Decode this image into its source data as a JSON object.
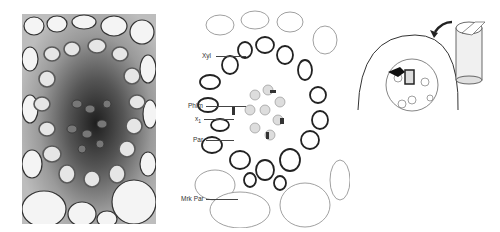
{
  "figure": {
    "panels": [
      {
        "id": "micrograph",
        "description": "light micrograph of vascular bundle cross-section"
      },
      {
        "id": "drawing",
        "description": "line drawing of vascular bundle"
      },
      {
        "id": "orientation",
        "description": "stem orientation diagram with cylinder and arrow"
      }
    ],
    "labels": [
      {
        "text": "Xyl",
        "x": 202,
        "y": 56
      },
      {
        "text": "Phlm",
        "x": 188,
        "y": 106
      },
      {
        "text": "x",
        "sub": "1",
        "x": 195,
        "y": 119
      },
      {
        "text": "Par",
        "x": 193,
        "y": 140
      },
      {
        "text": "Mrk Par",
        "x": 181,
        "y": 199
      }
    ],
    "colors": {
      "ink": "#222222",
      "cell_fill": "#ffffff",
      "photo_dark": "#2a2a2a",
      "photo_mid": "#8a8a8a",
      "shade": "#cfcfcf"
    }
  }
}
